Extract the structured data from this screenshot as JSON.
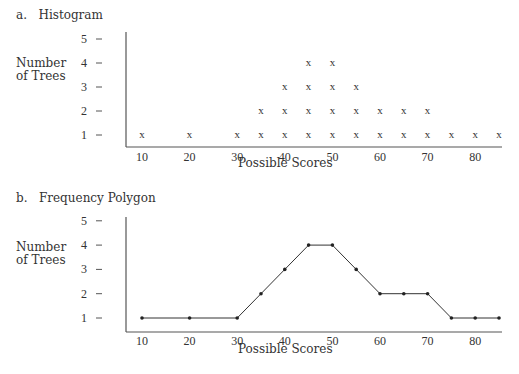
{
  "chart_data": [
    {
      "type": "scatter",
      "marker": "x",
      "panel_label": "a.",
      "title": "Histogram",
      "xlabel": "Possible Scores",
      "ylabel": "Number of Trees",
      "x_ticks": [
        "10",
        "20",
        "30",
        "40",
        "50",
        "60",
        "70",
        "80"
      ],
      "y_ticks": [
        "1",
        "2",
        "3",
        "4",
        "5"
      ],
      "ylim": [
        0,
        5
      ],
      "x": [
        10,
        20,
        30,
        35,
        40,
        45,
        50,
        55,
        60,
        65,
        70,
        75,
        80,
        85
      ],
      "values": [
        1,
        1,
        1,
        2,
        3,
        4,
        4,
        3,
        2,
        2,
        2,
        1,
        1,
        1
      ]
    },
    {
      "type": "line",
      "panel_label": "b.",
      "title": "Frequency Polygon",
      "xlabel": "Possible Scores",
      "ylabel": "Number of Trees",
      "x_ticks": [
        "10",
        "20",
        "30",
        "40",
        "50",
        "60",
        "70",
        "80"
      ],
      "y_ticks": [
        "1",
        "2",
        "3",
        "4",
        "5"
      ],
      "ylim": [
        0,
        5
      ],
      "x": [
        10,
        20,
        30,
        35,
        40,
        45,
        50,
        55,
        60,
        65,
        70,
        75,
        80,
        85
      ],
      "values": [
        1,
        1,
        1,
        2,
        3,
        4,
        4,
        3,
        2,
        2,
        2,
        1,
        1,
        1
      ]
    }
  ],
  "panels": {
    "a": {
      "label": "a.",
      "title": "Histogram",
      "ylabel_line1": "Number",
      "ylabel_line2": "of Trees",
      "xlabel": "Possible Scores"
    },
    "b": {
      "label": "b.",
      "title": "Frequency Polygon",
      "ylabel_line1": "Number",
      "ylabel_line2": "of Trees",
      "xlabel": "Possible Scores"
    }
  }
}
